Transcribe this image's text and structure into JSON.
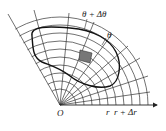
{
  "diagram": {
    "type": "polar-coordinate area element",
    "origin_label": "O",
    "radius_labels": [
      "r",
      "r + Δr"
    ],
    "angle_labels": [
      "θ + Δθ",
      "θ"
    ],
    "colors": {
      "lines": "#222222",
      "shaded_cell": "#777777",
      "background": "#ffffff"
    }
  }
}
